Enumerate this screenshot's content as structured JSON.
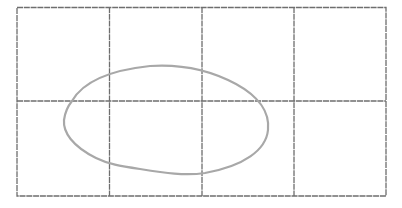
{
  "diagram": {
    "type": "hand-drawn grid with closed loop",
    "grid": {
      "columns": 4,
      "rows": 2,
      "x_lines": [
        17,
        109,
        202,
        294,
        386
      ],
      "y_lines": [
        7,
        101,
        196
      ],
      "stroke_color": "#6e6e6e"
    },
    "loop": {
      "shape": "irregular oval",
      "stroke_color": "#a8a8a8",
      "bounds": {
        "left": 64,
        "top": 66,
        "right": 268,
        "bottom": 175
      }
    },
    "background": "#ffffff"
  }
}
